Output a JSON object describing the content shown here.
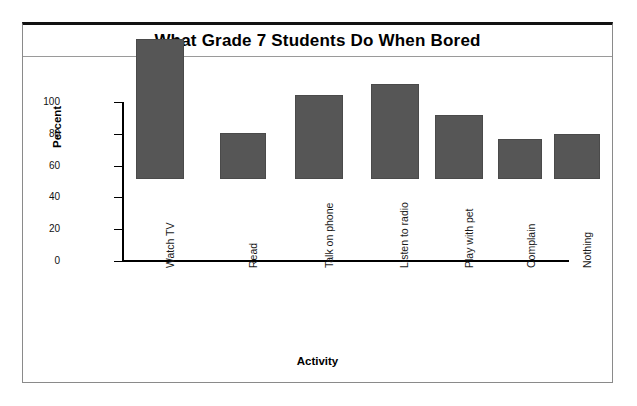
{
  "chart_data": {
    "type": "bar",
    "title": "What Grade 7 Students Do When Bored",
    "xlabel": "Activity",
    "ylabel": "Percent",
    "categories": [
      "Watch TV",
      "Read",
      "Talk on phone",
      "Listen to radio",
      "Play with pet",
      "Complain",
      "Nothing"
    ],
    "values": [
      88,
      29,
      53,
      60,
      40,
      25,
      28
    ],
    "ylim": [
      0,
      100
    ],
    "yticks": [
      0,
      20,
      40,
      60,
      80,
      100
    ],
    "ytick_labels": [
      "0",
      "20",
      "40",
      "60",
      "80",
      "100"
    ],
    "grid": false,
    "legend": null,
    "bar_color": "#565656",
    "axis_color": "#000000",
    "background": "#ffffff"
  }
}
